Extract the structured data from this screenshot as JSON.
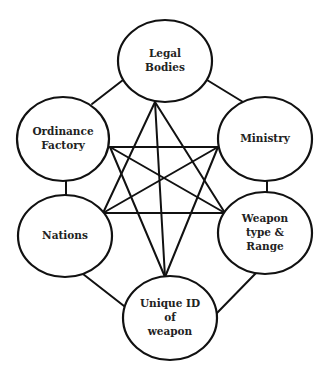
{
  "diagram": {
    "type": "network",
    "stroke_color": "#111111",
    "background": "#ffffff",
    "nodes": [
      {
        "id": "legal",
        "lines": [
          "Legal",
          "Bodies"
        ],
        "cx": 165,
        "cy": 61,
        "rx": 47,
        "ry": 41
      },
      {
        "id": "ordinance",
        "lines": [
          "Ordinance",
          "Factory"
        ],
        "cx": 63,
        "cy": 139,
        "rx": 46,
        "ry": 42
      },
      {
        "id": "ministry",
        "lines": [
          "Ministry"
        ],
        "cx": 265,
        "cy": 139,
        "rx": 47,
        "ry": 42
      },
      {
        "id": "nations",
        "lines": [
          "Nations"
        ],
        "cx": 65,
        "cy": 236,
        "rx": 47,
        "ry": 41
      },
      {
        "id": "weapon",
        "lines": [
          "Weapon",
          "type &",
          "Range"
        ],
        "cx": 265,
        "cy": 233,
        "rx": 47,
        "ry": 41
      },
      {
        "id": "uniqueid",
        "lines": [
          "Unique ID",
          "of",
          "weapon"
        ],
        "cx": 170,
        "cy": 318,
        "rx": 47,
        "ry": 42
      }
    ],
    "outer_edges": [
      {
        "from": "legal",
        "to": "ordinance",
        "x1": 123,
        "y1": 80,
        "x2": 92,
        "y2": 104
      },
      {
        "from": "legal",
        "to": "ministry",
        "x1": 207,
        "y1": 80,
        "x2": 243,
        "y2": 102
      },
      {
        "from": "ordinance",
        "to": "nations",
        "x1": 66,
        "y1": 180,
        "x2": 66,
        "y2": 196
      },
      {
        "from": "ministry",
        "to": "weapon",
        "x1": 267,
        "y1": 181,
        "x2": 267,
        "y2": 193
      },
      {
        "from": "nations",
        "to": "uniqueid",
        "x1": 83,
        "y1": 274,
        "x2": 124,
        "y2": 306
      },
      {
        "from": "weapon",
        "to": "uniqueid",
        "x1": 256,
        "y1": 273,
        "x2": 216,
        "y2": 314
      }
    ],
    "star_points": {
      "legal": [
        155,
        102
      ],
      "ordinance": [
        110,
        147
      ],
      "ministry": [
        218,
        147
      ],
      "nations": [
        103,
        213
      ],
      "weapon": [
        225,
        213
      ],
      "uniqueid": [
        165,
        277
      ]
    },
    "star_edges": [
      [
        "legal",
        "nations"
      ],
      [
        "legal",
        "weapon"
      ],
      [
        "legal",
        "uniqueid"
      ],
      [
        "ordinance",
        "ministry"
      ],
      [
        "ordinance",
        "weapon"
      ],
      [
        "ordinance",
        "uniqueid"
      ],
      [
        "ministry",
        "nations"
      ],
      [
        "ministry",
        "uniqueid"
      ],
      [
        "nations",
        "weapon"
      ]
    ]
  }
}
